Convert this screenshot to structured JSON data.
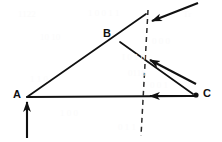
{
  "figure": {
    "background_color": "#ffffff",
    "stroke_color": "#111111",
    "width": 222,
    "height": 142
  },
  "labels": {
    "a": "A",
    "b": "B",
    "c": "C"
  },
  "points": {
    "a": {
      "label": "A",
      "x": 27,
      "y": 97,
      "marker": "none"
    },
    "b": {
      "label": "B",
      "x": 120,
      "y": 42,
      "marker": "none"
    },
    "c": {
      "label": "C",
      "x": 196,
      "y": 95,
      "marker": "dot"
    }
  },
  "lines": [
    {
      "name": "line-a-to-apex",
      "x1": 27,
      "y1": 97,
      "x2": 146,
      "y2": 14
    },
    {
      "name": "line-apex-to-c",
      "x1": 120,
      "y1": 42,
      "x2": 193,
      "y2": 94
    },
    {
      "name": "line-a-to-c",
      "x1": 27,
      "y1": 97,
      "x2": 190,
      "y2": 96
    }
  ],
  "dashed_line": {
    "name": "dashed-line",
    "x1": 148,
    "y1": 10,
    "x2": 141,
    "y2": 136,
    "dash": "5 4"
  },
  "arrows": [
    {
      "name": "arrow-top-diagonal",
      "direction": "down-left",
      "from_x": 198,
      "from_y": 3,
      "to_x": 150,
      "to_y": 22
    },
    {
      "name": "arrow-middle-diagonal",
      "direction": "up-left",
      "from_x": 196,
      "from_y": 84,
      "to_x": 147,
      "to_y": 58
    },
    {
      "name": "arrow-bottom-horizontal",
      "direction": "left",
      "from_x": 198,
      "from_y": 96,
      "to_x": 147,
      "to_y": 96
    },
    {
      "name": "arrow-vertical-at-a",
      "direction": "up",
      "from_x": 27,
      "from_y": 138,
      "to_x": 27,
      "to_y": 99
    }
  ],
  "ghost_text": [
    {
      "text": "1122",
      "x": 18,
      "y": 9
    },
    {
      "text": "1 0 0 1 1",
      "x": 88,
      "y": 8
    },
    {
      "text": "Tr",
      "x": 183,
      "y": 9
    },
    {
      "text": "10 10",
      "x": 40,
      "y": 32
    },
    {
      "text": "0 0 0",
      "x": 152,
      "y": 36
    },
    {
      "text": "I 0 1 0",
      "x": 122,
      "y": 52
    },
    {
      "text": "0110",
      "x": 128,
      "y": 68
    },
    {
      "text": "1 1 0",
      "x": 30,
      "y": 74
    },
    {
      "text": "0 0 1",
      "x": 150,
      "y": 80
    },
    {
      "text": "1 0 0",
      "x": 60,
      "y": 108
    },
    {
      "text": "0 1 1",
      "x": 118,
      "y": 122
    }
  ]
}
